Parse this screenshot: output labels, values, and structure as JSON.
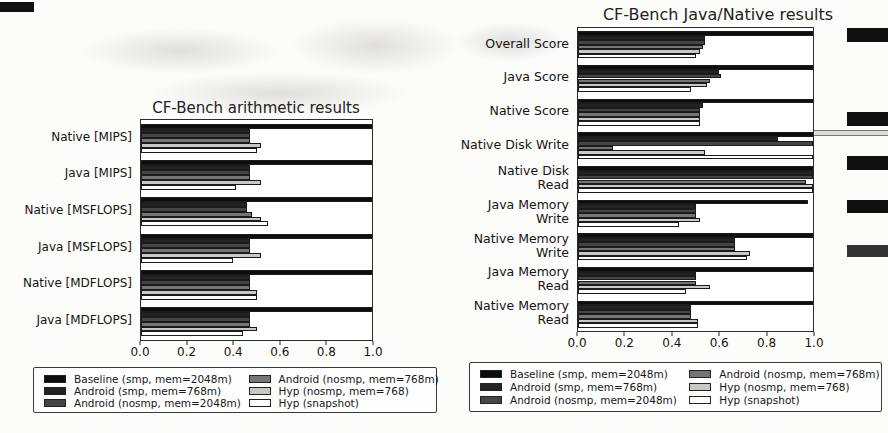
{
  "legend": {
    "items": [
      {
        "label": "Baseline (smp, mem=2048m)",
        "color": "#0d0d0d"
      },
      {
        "label": "Android (smp, mem=768m)",
        "color": "#232323"
      },
      {
        "label": "Android (nosmp, mem=2048m)",
        "color": "#454545"
      },
      {
        "label": "Android (nosmp, mem=768m)",
        "color": "#757575"
      },
      {
        "label": "Hyp (nosmp, mem=768)",
        "color": "#c8c8c5"
      },
      {
        "label": "Hyp (snapshot)",
        "color": "#ffffff"
      }
    ],
    "position": "below-chart"
  },
  "chart_data": [
    {
      "type": "bar",
      "orientation": "horizontal",
      "title": "CF-Bench arithmetic results",
      "xlabel": "",
      "ylabel": "",
      "xlim": [
        0.0,
        1.0
      ],
      "grid": false,
      "xticks": [
        "0.0",
        "0.2",
        "0.4",
        "0.6",
        "0.8",
        "1.0"
      ],
      "categories": [
        "Native [MIPS]",
        "Java [MIPS]",
        "Native [MSFLOPS]",
        "Java [MSFLOPS]",
        "Native [MDFLOPS]",
        "Java [MDFLOPS]"
      ],
      "series": [
        {
          "name": "Baseline (smp, mem=2048m)",
          "color": "#0d0d0d",
          "values": [
            1.0,
            1.0,
            1.0,
            1.0,
            1.0,
            1.0
          ]
        },
        {
          "name": "Android (smp, mem=768m)",
          "color": "#232323",
          "values": [
            0.47,
            0.47,
            0.46,
            0.47,
            0.47,
            0.47
          ]
        },
        {
          "name": "Android (nosmp, mem=2048m)",
          "color": "#454545",
          "values": [
            0.47,
            0.47,
            0.46,
            0.47,
            0.47,
            0.47
          ]
        },
        {
          "name": "Android (nosmp, mem=768m)",
          "color": "#757575",
          "values": [
            0.47,
            0.47,
            0.48,
            0.47,
            0.47,
            0.47
          ]
        },
        {
          "name": "Hyp (nosmp, mem=768)",
          "color": "#c8c8c5",
          "values": [
            0.52,
            0.52,
            0.52,
            0.52,
            0.5,
            0.5
          ]
        },
        {
          "name": "Hyp (snapshot)",
          "color": "#ffffff",
          "values": [
            0.5,
            0.41,
            0.55,
            0.4,
            0.5,
            0.44
          ]
        }
      ]
    },
    {
      "type": "bar",
      "orientation": "horizontal",
      "title": "CF-Bench Java/Native results",
      "xlabel": "",
      "ylabel": "",
      "xlim": [
        0.0,
        1.0
      ],
      "grid": false,
      "xticks": [
        "0.0",
        "0.2",
        "0.4",
        "0.6",
        "0.8",
        "1.0"
      ],
      "categories": [
        "Overall Score",
        "Java Score",
        "Native Score",
        "Native Disk Write",
        "Native Disk\nRead",
        "Java Memory\nWrite",
        "Native Memory\nWrite",
        "Java Memory\nRead",
        "Native Memory\nRead"
      ],
      "series": [
        {
          "name": "Baseline (smp, mem=2048m)",
          "color": "#0d0d0d",
          "values": [
            1.0,
            1.0,
            1.0,
            1.0,
            1.0,
            0.98,
            1.0,
            1.0,
            1.0
          ]
        },
        {
          "name": "Android (smp, mem=768m)",
          "color": "#232323",
          "values": [
            0.54,
            0.6,
            0.53,
            0.85,
            1.0,
            0.5,
            0.67,
            0.5,
            0.48
          ]
        },
        {
          "name": "Android (nosmp, mem=2048m)",
          "color": "#454545",
          "values": [
            0.54,
            0.61,
            0.52,
            1.0,
            1.0,
            0.5,
            0.67,
            0.5,
            0.48
          ]
        },
        {
          "name": "Android (nosmp, mem=768m)",
          "color": "#757575",
          "values": [
            0.53,
            0.56,
            0.52,
            0.15,
            0.97,
            0.5,
            0.67,
            0.5,
            0.48
          ]
        },
        {
          "name": "Hyp (nosmp, mem=768)",
          "color": "#c8c8c5",
          "values": [
            0.52,
            0.55,
            0.52,
            0.54,
            1.0,
            0.52,
            0.73,
            0.56,
            0.51
          ]
        },
        {
          "name": "Hyp (snapshot)",
          "color": "#ffffff",
          "values": [
            0.5,
            0.48,
            0.52,
            1.0,
            1.0,
            0.43,
            0.72,
            0.46,
            0.51
          ]
        }
      ]
    }
  ]
}
